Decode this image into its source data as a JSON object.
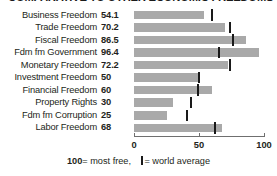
{
  "chart_title": "COMPARATIVE TO OTHER ECONOMIC FREEDOMS",
  "footnote": {
    "most_free_number": "100",
    "most_free_text": "= most free,",
    "world_average_text": "= world average",
    "world_average_marker": "world-average-tick"
  },
  "axis": {
    "ticks": [
      "0",
      "50",
      "100"
    ],
    "tick_values": [
      0,
      50,
      100
    ],
    "min": 0,
    "max": 100
  },
  "colors": {
    "bar": "#a9a9a9",
    "tick": "#1a1a1a",
    "text": "#231f20",
    "axis": "#6f6f6f",
    "background": "#ffffff"
  },
  "rows": [
    {
      "label": "Business Freedom",
      "value": "54.1",
      "score": 54.1,
      "world_average": 60
    },
    {
      "label": "Trade Freedom",
      "value": "70.2",
      "score": 70.2,
      "world_average": 74
    },
    {
      "label": "Fiscal Freedom",
      "value": "86.5",
      "score": 86.5,
      "world_average": 76
    },
    {
      "label": "Fdm fm Government",
      "value": "96.4",
      "score": 96.4,
      "world_average": 65
    },
    {
      "label": "Monetary Freedom",
      "value": "72.2",
      "score": 72.2,
      "world_average": 74
    },
    {
      "label": "Investment Freedom",
      "value": "50",
      "score": 50,
      "world_average": 50
    },
    {
      "label": "Financial Freedom",
      "value": "60",
      "score": 60,
      "world_average": 49
    },
    {
      "label": "Property Rights",
      "value": "30",
      "score": 30,
      "world_average": 44
    },
    {
      "label": "Fdm fm Corruption",
      "value": "25",
      "score": 25,
      "world_average": 41
    },
    {
      "label": "Labor Freedom",
      "value": "68",
      "score": 68,
      "world_average": 62
    }
  ],
  "chart_data": {
    "type": "bar",
    "title": "COMPARATIVE TO OTHER ECONOMIC FREEDOMS",
    "xlabel": "",
    "ylabel": "",
    "orientation": "horizontal",
    "xlim": [
      0,
      100
    ],
    "xticks": [
      0,
      50,
      100
    ],
    "grid": false,
    "legend_position": "bottom",
    "categories": [
      "Business Freedom",
      "Trade Freedom",
      "Fiscal Freedom",
      "Fdm fm Government",
      "Monetary Freedom",
      "Investment Freedom",
      "Financial Freedom",
      "Property Rights",
      "Fdm fm Corruption",
      "Labor Freedom"
    ],
    "series": [
      {
        "name": "Country score",
        "values": [
          54.1,
          70.2,
          86.5,
          96.4,
          72.2,
          50,
          60,
          30,
          25,
          68
        ]
      },
      {
        "name": "world average",
        "marker": "vertical-tick",
        "values": [
          60,
          74,
          76,
          65,
          74,
          50,
          49,
          44,
          41,
          62
        ]
      }
    ],
    "annotations": [
      "100 = most free,",
      "| = world average"
    ]
  }
}
